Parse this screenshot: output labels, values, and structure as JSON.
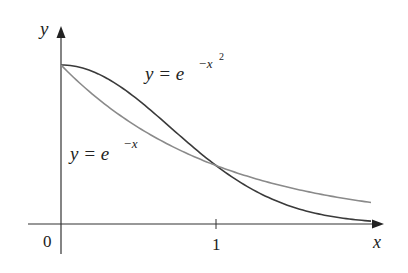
{
  "chart_data": {
    "type": "line",
    "title": "",
    "xlabel": "x",
    "ylabel": "y",
    "x_ticks": [
      "0",
      "1"
    ],
    "xlim": [
      0,
      2
    ],
    "ylim": [
      0,
      1
    ],
    "grid": false,
    "legend": "inline labels",
    "series": [
      {
        "name": "y = e^{-x^2}",
        "label_base": "y = e",
        "label_exp": "−x",
        "label_exp2": "2",
        "color": "#3a3a3a",
        "x": [
          0,
          0.25,
          0.5,
          0.75,
          1.0,
          1.25,
          1.5,
          1.75,
          2.0
        ],
        "values": [
          1.0,
          0.939,
          0.779,
          0.57,
          0.368,
          0.21,
          0.105,
          0.047,
          0.018
        ]
      },
      {
        "name": "y = e^{-x}",
        "label_base": "y = e",
        "label_exp": "−x",
        "color": "#8a8a8a",
        "x": [
          0,
          0.25,
          0.5,
          0.75,
          1.0,
          1.25,
          1.5,
          1.75,
          2.0
        ],
        "values": [
          1.0,
          0.779,
          0.607,
          0.472,
          0.368,
          0.287,
          0.223,
          0.174,
          0.135
        ]
      }
    ],
    "annotations": [
      "curves intersect at x = 1"
    ]
  }
}
